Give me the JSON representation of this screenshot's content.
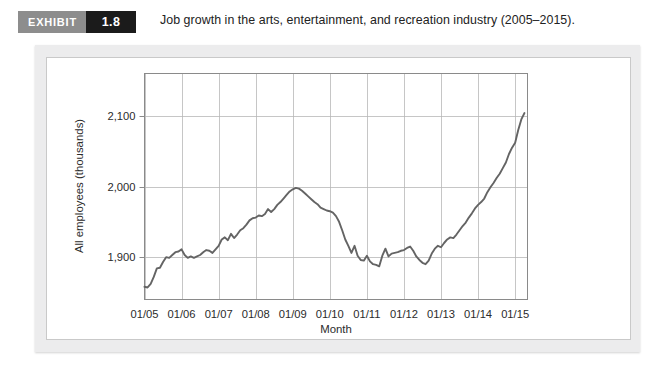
{
  "header": {
    "badge_word": "EXHIBIT",
    "badge_number": "1.8",
    "title": "Job growth in the arts, entertainment, and recreation industry (2005–2015)."
  },
  "chart_data": {
    "type": "line",
    "title": "Job growth in the arts, entertainment, and recreation industry (2005–2015).",
    "xlabel": "Month",
    "ylabel": "All employees (thousands)",
    "xlim": [
      0,
      124
    ],
    "ylim": [
      1840,
      2160
    ],
    "grid": true,
    "legend": null,
    "y_ticks": [
      1900,
      2000,
      2100
    ],
    "y_tick_labels": [
      "1,900",
      "2,000",
      "2,100"
    ],
    "x_ticks": [
      0,
      12,
      24,
      36,
      48,
      60,
      72,
      84,
      96,
      108,
      120
    ],
    "x_tick_labels": [
      "01/05",
      "01/06",
      "01/07",
      "01/08",
      "01/09",
      "01/10",
      "01/11",
      "01/12",
      "01/13",
      "01/14",
      "01/15"
    ],
    "line_color": "#646464",
    "grid_color": "#b8b8b8",
    "series": [
      {
        "name": "All employees (thousands)",
        "x": [
          0,
          1,
          2,
          3,
          4,
          5,
          6,
          7,
          8,
          9,
          10,
          11,
          12,
          13,
          14,
          15,
          16,
          17,
          18,
          19,
          20,
          21,
          22,
          23,
          24,
          25,
          26,
          27,
          28,
          29,
          30,
          31,
          32,
          33,
          34,
          35,
          36,
          37,
          38,
          39,
          40,
          41,
          42,
          43,
          44,
          45,
          46,
          47,
          48,
          49,
          50,
          51,
          52,
          53,
          54,
          55,
          56,
          57,
          58,
          59,
          60,
          61,
          62,
          63,
          64,
          65,
          66,
          67,
          68,
          69,
          70,
          71,
          72,
          73,
          74,
          75,
          76,
          77,
          78,
          79,
          80,
          81,
          82,
          83,
          84,
          85,
          86,
          87,
          88,
          89,
          90,
          91,
          92,
          93,
          94,
          95,
          96,
          97,
          98,
          99,
          100,
          101,
          102,
          103,
          104,
          105,
          106,
          107,
          108,
          109,
          110,
          111,
          112,
          113,
          114,
          115,
          116,
          117,
          118,
          119,
          120,
          121,
          122,
          123
        ],
        "values": [
          1858,
          1857,
          1862,
          1872,
          1884,
          1885,
          1893,
          1900,
          1899,
          1903,
          1907,
          1908,
          1911,
          1903,
          1899,
          1901,
          1899,
          1901,
          1903,
          1907,
          1910,
          1909,
          1906,
          1911,
          1916,
          1925,
          1928,
          1924,
          1933,
          1927,
          1932,
          1938,
          1941,
          1946,
          1952,
          1955,
          1956,
          1959,
          1958,
          1961,
          1968,
          1964,
          1968,
          1974,
          1978,
          1983,
          1988,
          1993,
          1996,
          1998,
          1997,
          1994,
          1990,
          1986,
          1982,
          1978,
          1975,
          1970,
          1968,
          1966,
          1965,
          1963,
          1958,
          1950,
          1938,
          1925,
          1916,
          1906,
          1916,
          1902,
          1896,
          1895,
          1902,
          1894,
          1890,
          1889,
          1887,
          1902,
          1912,
          1901,
          1905,
          1906,
          1907,
          1909,
          1910,
          1913,
          1915,
          1909,
          1901,
          1896,
          1892,
          1890,
          1895,
          1905,
          1912,
          1916,
          1914,
          1920,
          1925,
          1928,
          1927,
          1932,
          1938,
          1944,
          1949,
          1956,
          1962,
          1969,
          1974,
          1978,
          1983,
          1992,
          1999,
          2005,
          2012,
          2018,
          2026,
          2034,
          2046,
          2055,
          2062,
          2080,
          2095,
          2104
        ],
        "peak_value": 2141,
        "end_value": 2128
      }
    ]
  }
}
